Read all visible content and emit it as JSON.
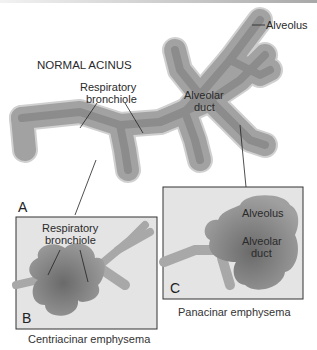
{
  "figure": {
    "normal": {
      "title": "NORMAL ACINUS",
      "panel_letter": "A",
      "labels": {
        "alveolus": "Alveolus",
        "respiratory_bronchiole_line1": "Respiratory",
        "respiratory_bronchiole_line2": "bronchiole",
        "alveolar_duct_line1": "Alveolar",
        "alveolar_duct_line2": "duct"
      }
    },
    "centriacinar": {
      "panel_letter": "B",
      "caption": "Centriacinar emphysema",
      "labels": {
        "respiratory_bronchiole_line1": "Respiratory",
        "respiratory_bronchiole_line2": "bronchiole"
      }
    },
    "panacinar": {
      "panel_letter": "C",
      "caption": "Panacinar emphysema",
      "labels": {
        "alveolus": "Alveolus",
        "alveolar_duct_line1": "Alveolar",
        "alveolar_duct_line2": "duct"
      }
    },
    "colors": {
      "tissue": "#9a9a9a",
      "tissue_dark": "#6e6e6e",
      "tissue_light": "#b8b8b8",
      "outline": "#d8d8d8",
      "panel_bg": "#e4e4e4",
      "panel_border": "#333333",
      "leader_line": "#222222"
    }
  }
}
